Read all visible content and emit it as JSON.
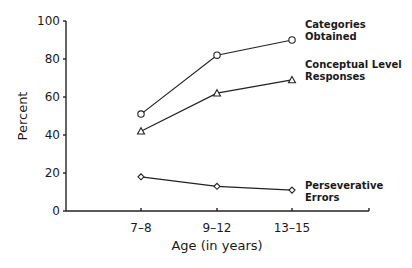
{
  "chart_data": {
    "type": "line",
    "title": "",
    "xlabel": "Age (in years)",
    "ylabel": "Percent",
    "categories": [
      "7-8",
      "9-12",
      "13-15"
    ],
    "ylim": [
      0,
      100
    ],
    "yticks": [
      0,
      20,
      40,
      60,
      80,
      100
    ],
    "grid": false,
    "legend_position": "inline labels at right end of each series",
    "series": [
      {
        "name": "Categories Obtained",
        "label_lines": [
          "Categories",
          "Obtained"
        ],
        "marker": "circle",
        "values": [
          51,
          82,
          90
        ]
      },
      {
        "name": "Conceptual Level Responses",
        "label_lines": [
          "Conceptual Level",
          "Responses"
        ],
        "marker": "triangle",
        "values": [
          42,
          62,
          69
        ]
      },
      {
        "name": "Perseverative Errors",
        "label_lines": [
          "Perseverative",
          "Errors"
        ],
        "marker": "diamond",
        "values": [
          18,
          13,
          11
        ]
      }
    ]
  },
  "axes": {
    "x_tick_labels": [
      "7–8",
      "9–12",
      "13–15"
    ],
    "y_tick_labels": [
      "0",
      "20",
      "40",
      "60",
      "80",
      "100"
    ],
    "xlabel": "Age (in years)",
    "ylabel": "Percent"
  }
}
